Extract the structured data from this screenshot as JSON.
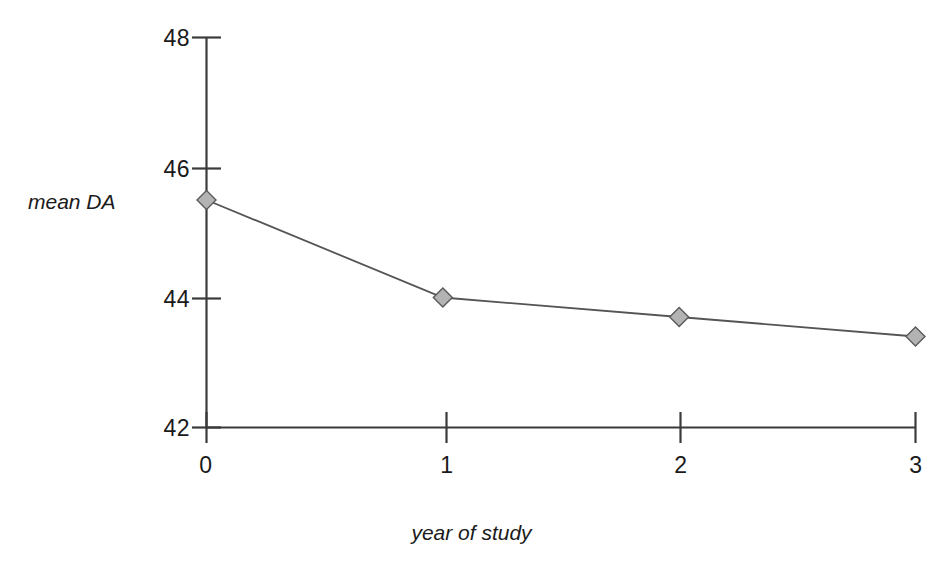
{
  "chart_data": {
    "type": "line",
    "title": "",
    "xlabel": "year of study",
    "ylabel": "mean DA",
    "x": [
      0,
      1,
      2,
      3
    ],
    "categories": [
      "0",
      "1",
      "2",
      "3"
    ],
    "values": [
      45.5,
      44.0,
      43.7,
      43.4
    ],
    "series": [
      {
        "name": "mean DA",
        "values": [
          45.5,
          44.0,
          43.7,
          43.4
        ]
      }
    ],
    "xlim": [
      0,
      3
    ],
    "ylim": [
      42,
      48
    ],
    "x_ticks": [
      "0",
      "1",
      "2",
      "3"
    ],
    "y_ticks": [
      "42",
      "44",
      "46",
      "48"
    ],
    "grid": false,
    "legend": false,
    "legend_position": "none",
    "marker": "diamond",
    "marker_fill": "#b3b3b3",
    "marker_stroke": "#5a5a5a",
    "line_color": "#555555",
    "axis_color": "#3b3b3b",
    "background": "#ffffff"
  },
  "axis": {
    "y_title": "mean DA",
    "x_title": "year of study",
    "y_tick_labels": [
      "48",
      "46",
      "44",
      "42"
    ],
    "x_tick_labels": [
      "0",
      "1",
      "2",
      "3"
    ]
  }
}
